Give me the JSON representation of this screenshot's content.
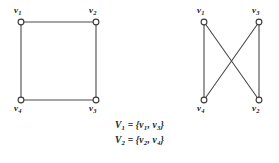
{
  "figure": {
    "background_color": "#ffffff",
    "edge_color": "#4a4a4a",
    "vertex_stroke_color": "#3a3a3a",
    "vertex_fill_color": "#ffffff",
    "text_color": "#1b1b1b"
  },
  "graphs": [
    {
      "id": "graph-left",
      "name": "square-cycle-graph",
      "vertices": [
        {
          "id": "v1",
          "label": "v",
          "subscript": "1",
          "cx": 21,
          "cy": 22,
          "label_x": 14,
          "label_y": 6
        },
        {
          "id": "v2",
          "label": "v",
          "subscript": "2",
          "cx": 96,
          "cy": 22,
          "label_x": 89,
          "label_y": 6
        },
        {
          "id": "v3",
          "label": "v",
          "subscript": "3",
          "cx": 96,
          "cy": 100,
          "label_x": 89,
          "label_y": 104
        },
        {
          "id": "v4",
          "label": "v",
          "subscript": "4",
          "cx": 21,
          "cy": 100,
          "label_x": 14,
          "label_y": 104
        }
      ],
      "edges": [
        {
          "from": "v1",
          "to": "v2"
        },
        {
          "from": "v2",
          "to": "v3"
        },
        {
          "from": "v3",
          "to": "v4"
        },
        {
          "from": "v4",
          "to": "v1"
        }
      ]
    },
    {
      "id": "graph-right",
      "name": "bipartite-redraw-graph",
      "vertices": [
        {
          "id": "v1",
          "label": "v",
          "subscript": "1",
          "cx": 64,
          "cy": 22,
          "label_x": 57,
          "label_y": 6
        },
        {
          "id": "v3",
          "label": "v",
          "subscript": "3",
          "cx": 119,
          "cy": 22,
          "label_x": 112,
          "label_y": 6
        },
        {
          "id": "v4",
          "label": "v",
          "subscript": "4",
          "cx": 64,
          "cy": 100,
          "label_x": 57,
          "label_y": 104
        },
        {
          "id": "v2",
          "label": "v",
          "subscript": "2",
          "cx": 119,
          "cy": 100,
          "label_x": 112,
          "label_y": 104
        }
      ],
      "edges": [
        {
          "from": "v1",
          "to": "v4"
        },
        {
          "from": "v3",
          "to": "v2"
        },
        {
          "from": "v1",
          "to": "v2"
        },
        {
          "from": "v3",
          "to": "v4"
        }
      ]
    }
  ],
  "caption": {
    "lines": [
      {
        "set_name": "V",
        "set_sub": "1",
        "equals": " = {",
        "member1": "v",
        "member1_sub": "1",
        "comma": ", ",
        "member2": "v",
        "member2_sub": "3",
        "close": "}"
      },
      {
        "set_name": "V",
        "set_sub": "2",
        "equals": " = {",
        "member1": "v",
        "member1_sub": "2",
        "comma": ", ",
        "member2": "v",
        "member2_sub": "4",
        "close": "}"
      }
    ]
  }
}
